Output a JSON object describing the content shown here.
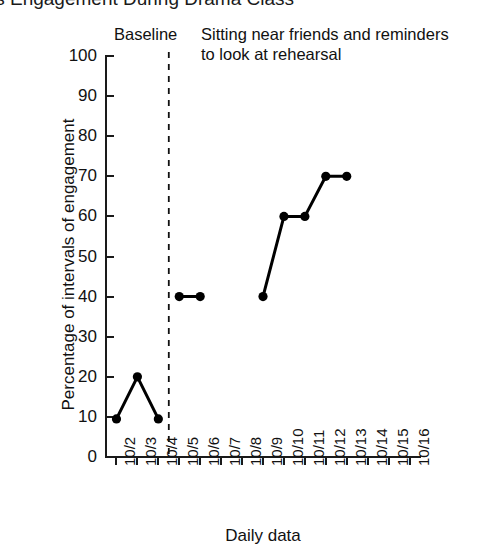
{
  "chart": {
    "title": "line's Engagement During Drama Class",
    "title_note_clipped": true
  },
  "phases": [
    {
      "id": "baseline",
      "label": "Baseline"
    },
    {
      "id": "intervention",
      "label": "Sitting near friends and reminders to look at rehearsal"
    }
  ],
  "axes": {
    "y_title": "Percentage of intervals of engagement",
    "x_title": "Daily data"
  },
  "chart_data": {
    "type": "line",
    "title": "line's Engagement During Drama Class",
    "xlabel": "Daily data",
    "ylabel": "Percentage of intervals of engagement",
    "ylim": [
      0,
      100
    ],
    "ytick_labels": [
      "0",
      "10",
      "20",
      "30",
      "40",
      "50",
      "60",
      "70",
      "80",
      "90",
      "100"
    ],
    "yticks": [
      0,
      10,
      20,
      30,
      40,
      50,
      60,
      70,
      80,
      90,
      100
    ],
    "grid": false,
    "legend": "none",
    "categories": [
      "10/2",
      "10/3",
      "10/4",
      "10/5",
      "10/6",
      "10/7",
      "10/8",
      "10/9",
      "10/10",
      "10/11",
      "10/12",
      "10/13",
      "10/14",
      "10/15",
      "10/16"
    ],
    "phase_change_after": "10/4",
    "phase_line_style": "dashed",
    "series": [
      {
        "name": "Baseline",
        "x": [
          "10/2",
          "10/3",
          "10/4"
        ],
        "values": [
          9.5,
          20,
          9.5
        ]
      },
      {
        "name": "Sitting near friends and reminders to look at rehearsal",
        "x": [
          "10/5",
          "10/6",
          "10/9",
          "10/10",
          "10/11",
          "10/12",
          "10/13"
        ],
        "values": [
          40,
          40,
          40,
          60,
          60,
          70,
          70
        ],
        "breaks_after": [
          "10/6"
        ],
        "no_data_days": [
          "10/7",
          "10/8",
          "10/14",
          "10/15",
          "10/16"
        ]
      }
    ],
    "marker": "filled-circle",
    "marker_color": "#000000",
    "line_color": "#000000"
  }
}
